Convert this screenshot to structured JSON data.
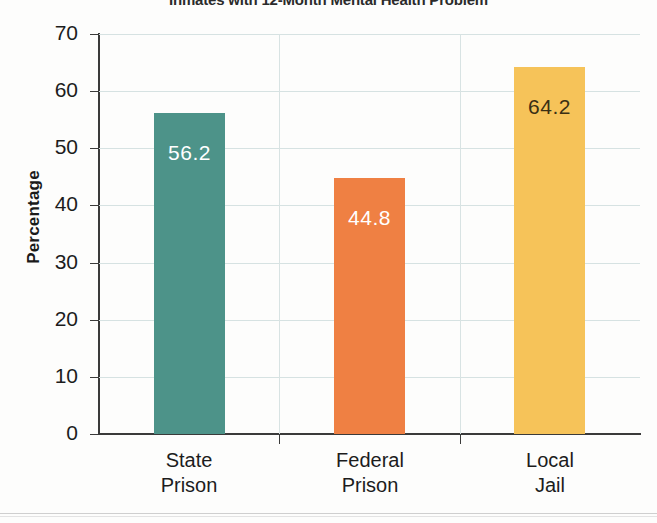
{
  "chart_data": {
    "type": "bar",
    "title": "Inmates with 12-Month Mental Health Problem",
    "xlabel": "",
    "ylabel": "Percentage",
    "categories": [
      "State Prison",
      "Federal Prison",
      "Local Jail"
    ],
    "category_lines": [
      [
        "State",
        "Prison"
      ],
      [
        "Federal",
        "Prison"
      ],
      [
        "Local",
        "Jail"
      ]
    ],
    "values": [
      56.2,
      44.8,
      64.2
    ],
    "value_labels": [
      "56.2",
      "44.8",
      "64.2"
    ],
    "bar_colors": [
      "#4d9389",
      "#ef8043",
      "#f6c359"
    ],
    "value_label_colors": [
      "#ffffff",
      "#ffffff",
      "#3a2f14"
    ],
    "ylim": [
      0,
      70
    ],
    "yticks": [
      0,
      10,
      20,
      30,
      40,
      50,
      60,
      70
    ],
    "ytick_labels": [
      "0",
      "10",
      "20",
      "30",
      "40",
      "50",
      "60",
      "70"
    ],
    "grid": true,
    "grid_color": "#d6e2e2",
    "legend": null,
    "legend_position": "none"
  }
}
